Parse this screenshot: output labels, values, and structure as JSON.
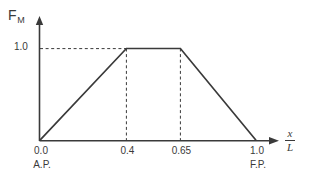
{
  "figure": {
    "background_color": "#ffffff",
    "line_color": "#3a3a3a"
  },
  "chart_data": {
    "type": "line",
    "title": "",
    "subtitle": "",
    "xlabel": "x/L",
    "ylabel": "F_M",
    "ylabel_base": "F",
    "ylabel_sub": "M",
    "xlabel_numerator": "x",
    "xlabel_denominator": "L",
    "x": [
      0.0,
      0.4,
      0.65,
      1.0
    ],
    "y": [
      0.0,
      1.0,
      1.0,
      0.0
    ],
    "series": [
      {
        "name": "F_M",
        "x": [
          0.0,
          0.4,
          0.65,
          1.0
        ],
        "values": [
          0.0,
          1.0,
          1.0,
          0.0
        ]
      }
    ],
    "xlim": [
      0.0,
      1.08
    ],
    "ylim": [
      0.0,
      1.22
    ],
    "x_ticks": [
      0.0,
      0.4,
      0.65,
      1.0
    ],
    "x_tick_labels": [
      "0.0",
      "0.4",
      "0.65",
      "1.0"
    ],
    "y_ticks": [
      1.0
    ],
    "y_tick_labels": [
      "1.0"
    ],
    "grid": false,
    "legend": null,
    "legend_position": "none",
    "annotations": [
      {
        "name": "start-station",
        "text": "A.P.",
        "x": 0.0,
        "y": 0.0
      },
      {
        "name": "end-station",
        "text": "F.P.",
        "x": 1.0,
        "y": 0.0
      }
    ],
    "guide_lines": [
      {
        "name": "y-guide-1.0",
        "orientation": "horizontal",
        "value": 1.0,
        "from": 0.0,
        "to": 0.4,
        "style": "dashed"
      },
      {
        "name": "x-guide-0.4",
        "orientation": "vertical",
        "value": 0.4,
        "from": 0.0,
        "to": 1.0,
        "style": "dashed"
      },
      {
        "name": "x-guide-0.65",
        "orientation": "vertical",
        "value": 0.65,
        "from": 0.0,
        "to": 1.0,
        "style": "dashed"
      }
    ],
    "axis_arrows": {
      "x": true,
      "y": true
    }
  },
  "labels": {
    "y_axis_title_base": "F",
    "y_axis_title_sub": "M",
    "y_tick_1": "1.0",
    "x_tick_0": "0.0",
    "x_tick_04": "0.4",
    "x_tick_065": "0.65",
    "x_tick_10": "1.0",
    "station_start": "A.P.",
    "station_end": "F.P.",
    "x_axis_numerator": "x",
    "x_axis_denominator": "L"
  }
}
